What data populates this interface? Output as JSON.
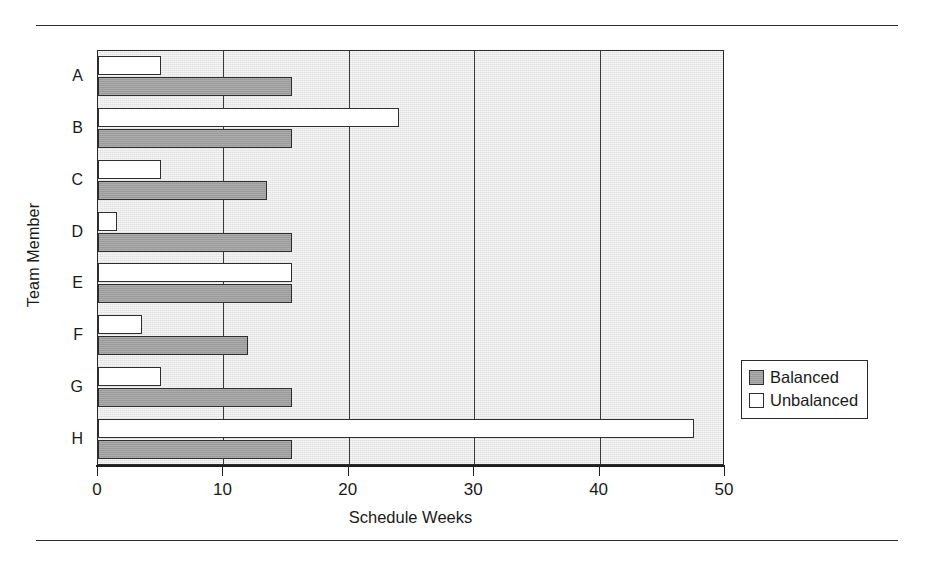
{
  "figure": {
    "rules": [
      "top-rule",
      "bottom-rule"
    ]
  },
  "chart_data": {
    "type": "bar",
    "orientation": "horizontal",
    "title": "",
    "xlabel": "Schedule Weeks",
    "ylabel": "Team Member",
    "categories": [
      "A",
      "B",
      "C",
      "D",
      "E",
      "F",
      "G",
      "H"
    ],
    "series": [
      {
        "name": "Unbalanced",
        "color": "#ffffff",
        "values": [
          5,
          24,
          5,
          1.5,
          15.5,
          3.5,
          5,
          47.5
        ]
      },
      {
        "name": "Balanced",
        "color": "#9a9a9a",
        "values": [
          15.5,
          15.5,
          13.5,
          15.5,
          15.5,
          12,
          15.5,
          15.5
        ]
      }
    ],
    "xlim": [
      0,
      50
    ],
    "xticks": [
      0,
      10,
      20,
      30,
      40,
      50
    ],
    "xtick_labels": [
      "0",
      "10",
      "20",
      "30",
      "40",
      "50"
    ],
    "grid": true,
    "grid_axis": "x",
    "legend_position": "right",
    "plot_background": "#e9e9e9",
    "axis_color": "#2b2b2b"
  },
  "legend": {
    "items": [
      {
        "label": "Balanced",
        "style": "balanced"
      },
      {
        "label": "Unbalanced",
        "style": "unbalanced"
      }
    ]
  }
}
